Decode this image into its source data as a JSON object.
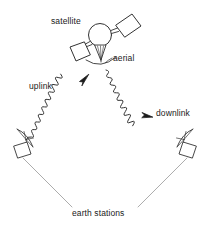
{
  "diagram": {
    "background_color": "#ffffff",
    "stroke_color": "#333333",
    "text_color": "#1a1a1a",
    "labels": {
      "satellite": "satellite",
      "aerial": "aerial",
      "uplink": "uplink",
      "downlink": "downlink",
      "earth_stations": "earth stations"
    },
    "components": {
      "satellite_body": "circle",
      "solar_panels": 2,
      "horn_antenna": "cone",
      "earth_station_count": 2,
      "signal_paths": [
        "uplink",
        "downlink"
      ]
    }
  }
}
